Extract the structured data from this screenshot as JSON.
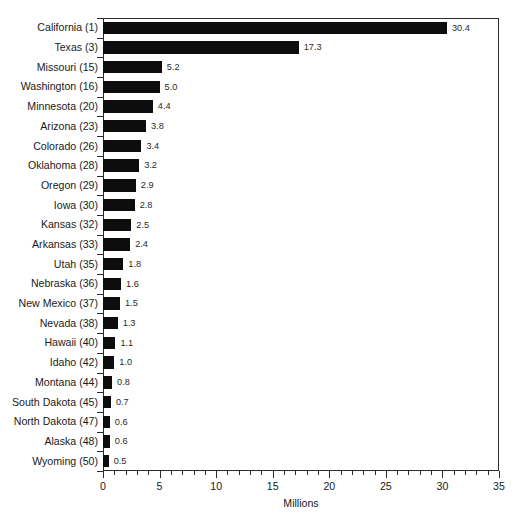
{
  "chart_data": {
    "type": "bar",
    "orientation": "horizontal",
    "title": "",
    "subtitle": "",
    "xlabel": "Millions",
    "ylabel": "",
    "xlim": [
      0,
      35
    ],
    "xticks": [
      0,
      5,
      10,
      15,
      20,
      25,
      30,
      35
    ],
    "xtick_labels": [
      "0",
      "5",
      "10",
      "15",
      "20",
      "25",
      "30",
      "35"
    ],
    "minor_tick_step": 1,
    "grid": false,
    "legend": null,
    "bar_color": "#0d0d0d",
    "frame_color": "#2b2b2b",
    "background": "#ffffff",
    "categories": [
      "California (1)",
      "Texas (3)",
      "Missouri (15)",
      "Washington (16)",
      "Minnesota (20)",
      "Arizona (23)",
      "Colorado (26)",
      "Oklahoma (28)",
      "Oregon (29)",
      "Iowa (30)",
      "Kansas (32)",
      "Arkansas (33)",
      "Utah (35)",
      "Nebraska (36)",
      "New Mexico (37)",
      "Nevada (38)",
      "Hawaii (40)",
      "Idaho (42)",
      "Montana (44)",
      "South Dakota (45)",
      "North Dakota (47)",
      "Alaska (48)",
      "Wyoming (50)"
    ],
    "values": [
      30.4,
      17.3,
      5.2,
      5.0,
      4.4,
      3.8,
      3.4,
      3.2,
      2.9,
      2.8,
      2.5,
      2.4,
      1.8,
      1.6,
      1.5,
      1.3,
      1.1,
      1.0,
      0.8,
      0.7,
      0.6,
      0.6,
      0.5
    ],
    "value_labels": [
      "30.4",
      "17.3",
      "5.2",
      "5.0",
      "4.4",
      "3.8",
      "3.4",
      "3.2",
      "2.9",
      "2.8",
      "2.5",
      "2.4",
      "1.8",
      "1.6",
      "1.5",
      "1.3",
      "1.1",
      "1.0",
      "0.8",
      "0.7",
      "0.6",
      "0.6",
      "0.5"
    ]
  }
}
